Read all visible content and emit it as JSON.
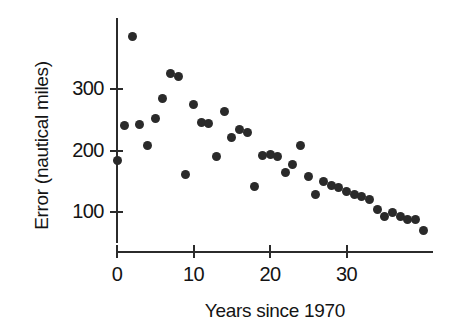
{
  "chart_data": {
    "type": "scatter",
    "title": "",
    "xlabel": "Years since 1970",
    "ylabel": "Error (nautical miles)",
    "xlim": [
      -2,
      41
    ],
    "ylim": [
      50,
      400
    ],
    "grid": false,
    "legend": null,
    "xticks": [
      0,
      10,
      20,
      30
    ],
    "yticks": [
      100,
      200,
      300
    ],
    "xtick_labels": [
      "0",
      "10",
      "20",
      "30"
    ],
    "ytick_labels": [
      "100",
      "200",
      "300"
    ],
    "marker": {
      "shape": "circle",
      "color": "#2a2a2a",
      "size": 9
    },
    "points": [
      {
        "x": 0,
        "y": 183
      },
      {
        "x": 2,
        "y": 385
      },
      {
        "x": 1,
        "y": 240
      },
      {
        "x": 3,
        "y": 243
      },
      {
        "x": 4,
        "y": 208
      },
      {
        "x": 5,
        "y": 252
      },
      {
        "x": 6,
        "y": 284
      },
      {
        "x": 7,
        "y": 325
      },
      {
        "x": 8,
        "y": 320
      },
      {
        "x": 9,
        "y": 161
      },
      {
        "x": 10,
        "y": 274
      },
      {
        "x": 11,
        "y": 245
      },
      {
        "x": 12,
        "y": 244
      },
      {
        "x": 13,
        "y": 191
      },
      {
        "x": 14,
        "y": 264
      },
      {
        "x": 15,
        "y": 221
      },
      {
        "x": 16,
        "y": 234
      },
      {
        "x": 17,
        "y": 230
      },
      {
        "x": 18,
        "y": 141
      },
      {
        "x": 19,
        "y": 192
      },
      {
        "x": 20,
        "y": 193
      },
      {
        "x": 21,
        "y": 191
      },
      {
        "x": 22,
        "y": 165
      },
      {
        "x": 23,
        "y": 178
      },
      {
        "x": 24,
        "y": 208
      },
      {
        "x": 25,
        "y": 158
      },
      {
        "x": 26,
        "y": 128
      },
      {
        "x": 27,
        "y": 149
      },
      {
        "x": 28,
        "y": 143
      },
      {
        "x": 29,
        "y": 140
      },
      {
        "x": 30,
        "y": 134
      },
      {
        "x": 31,
        "y": 129
      },
      {
        "x": 32,
        "y": 125
      },
      {
        "x": 33,
        "y": 120
      },
      {
        "x": 34,
        "y": 104
      },
      {
        "x": 35,
        "y": 93
      },
      {
        "x": 36,
        "y": 99
      },
      {
        "x": 37,
        "y": 92
      },
      {
        "x": 38,
        "y": 88
      },
      {
        "x": 39,
        "y": 87
      },
      {
        "x": 40,
        "y": 70
      }
    ]
  },
  "axes": {
    "y_label": "Error (nautical miles)",
    "x_label": "Years since 1970",
    "y_ticks": [
      {
        "value": 300,
        "label": "300"
      },
      {
        "value": 200,
        "label": "200"
      },
      {
        "value": 100,
        "label": "100"
      }
    ],
    "x_ticks": [
      {
        "value": 0,
        "label": "0"
      },
      {
        "value": 10,
        "label": "10"
      },
      {
        "value": 20,
        "label": "20"
      },
      {
        "value": 30,
        "label": "30"
      }
    ]
  },
  "colors": {
    "marker": "#2a2a2a",
    "axis": "#2b2b2b",
    "text": "#141414",
    "background": "#ffffff"
  }
}
